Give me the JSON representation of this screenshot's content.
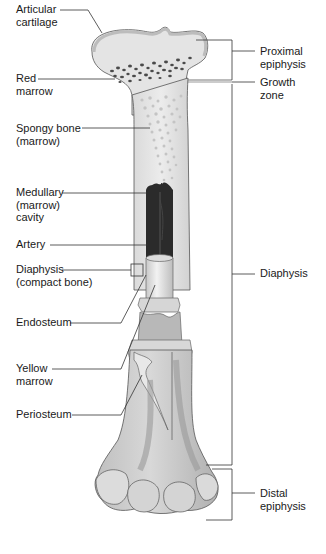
{
  "diagram": {
    "left_labels": [
      {
        "id": "articular-cartilage",
        "text": "Articular\ncartilage",
        "x": 16,
        "y": 3
      },
      {
        "id": "red-marrow",
        "text": "Red\nmarrow",
        "x": 16,
        "y": 72
      },
      {
        "id": "spongy-bone",
        "text": "Spongy bone\n(marrow)",
        "x": 16,
        "y": 122
      },
      {
        "id": "medullary-cavity",
        "text": "Medullary\n(marrow)\ncavity",
        "x": 16,
        "y": 186
      },
      {
        "id": "artery",
        "text": "Artery",
        "x": 16,
        "y": 238
      },
      {
        "id": "diaphysis-compact",
        "text": "Diaphysis\n(compact bone)",
        "x": 16,
        "y": 263
      },
      {
        "id": "endosteum",
        "text": "Endosteum",
        "x": 16,
        "y": 316
      },
      {
        "id": "yellow-marrow",
        "text": "Yellow\nmarrow",
        "x": 16,
        "y": 362
      },
      {
        "id": "periosteum",
        "text": "Periosteum",
        "x": 16,
        "y": 408
      }
    ],
    "right_labels": [
      {
        "id": "proximal-epiphysis",
        "text": "Proximal\nepiphysis",
        "x": 260,
        "y": 45
      },
      {
        "id": "growth-zone",
        "text": "Growth\nzone",
        "x": 260,
        "y": 76
      },
      {
        "id": "diaphysis",
        "text": "Diaphysis",
        "x": 260,
        "y": 266
      },
      {
        "id": "distal-epiphysis",
        "text": "Distal\nepiphysis",
        "x": 260,
        "y": 486
      }
    ],
    "colors": {
      "line": "#333333",
      "bone_light": "#e6e6e6",
      "bone_mid": "#cfcfcf",
      "bone_dark": "#9a9a9a",
      "cavity": "#2a2a2a",
      "spongy_dot": "#bdbdbd",
      "red_marrow_dot": "#444444"
    }
  }
}
